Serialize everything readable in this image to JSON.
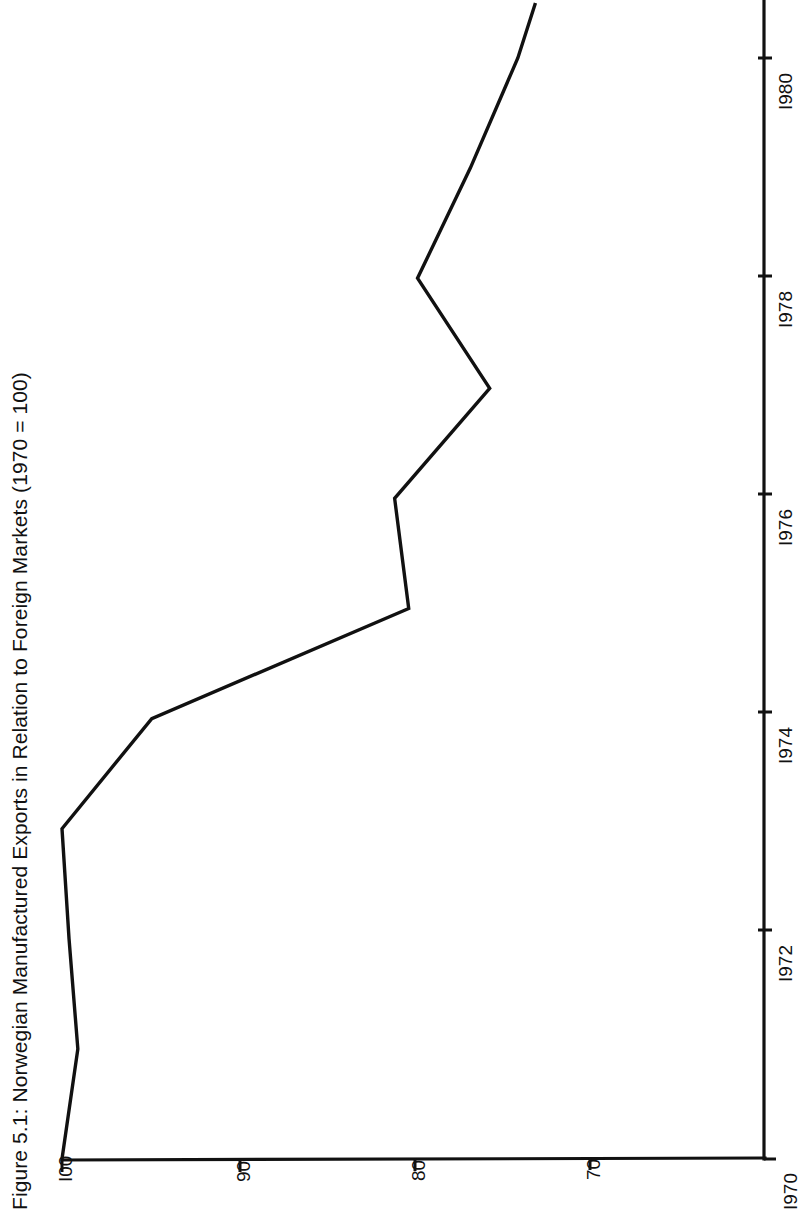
{
  "figure": {
    "title": "Figure 5.1:  Norwegian Manufactured Exports in Relation to Foreign Markets (1970 = 100)",
    "orientation": "rotated-90-ccw",
    "background_color": "#ffffff",
    "line_color": "#111111"
  },
  "axes": {
    "value_axis": {
      "name": "index-axis",
      "tick_labels": [
        "I00",
        "90",
        "80",
        "70"
      ],
      "tick_values": [
        100,
        90,
        80,
        70
      ],
      "min": 70,
      "max": 100
    },
    "time_axis": {
      "name": "year-axis",
      "tick_labels": [
        "I970",
        "I972",
        "I974",
        "I976",
        "I978",
        "I980"
      ],
      "tick_values": [
        1970,
        1972,
        1974,
        1976,
        1978,
        1980
      ],
      "min": 1970,
      "max": 1980.5
    }
  },
  "chart_data": {
    "type": "line",
    "title": "Figure 5.1:  Norwegian Manufactured Exports in Relation to Foreign Markets (1970 = 100)",
    "xlabel": "",
    "ylabel": "",
    "x": [
      1970,
      1971,
      1972,
      1973,
      1974,
      1975,
      1976,
      1977,
      1978,
      1979,
      1980,
      1980.5
    ],
    "values": [
      100.0,
      99.1,
      99.6,
      100.0,
      94.9,
      80.3,
      81.1,
      75.7,
      79.8,
      76.8,
      74.1,
      73.1
    ],
    "series": [
      {
        "name": "Norwegian manufactured exports relative to foreign markets",
        "values": [
          100.0,
          99.1,
          99.6,
          100.0,
          94.9,
          80.3,
          81.1,
          75.7,
          79.8,
          76.8,
          74.1,
          73.1
        ]
      }
    ],
    "xlim": [
      1970,
      1980.5
    ],
    "ylim": [
      70,
      100
    ],
    "grid": false,
    "legend": "none",
    "xtick_labels": [
      "I970",
      "I972",
      "I974",
      "I976",
      "I978",
      "I980"
    ],
    "xticks": [
      1970,
      1972,
      1974,
      1976,
      1978,
      1980
    ],
    "ytick_labels": [
      "I00",
      "90",
      "80",
      "70"
    ],
    "yticks": [
      100,
      90,
      80,
      70
    ],
    "note": "Chart is printed rotated 90 degrees counter-clockwise on the page; the index axis runs horizontally along the bottom and the year axis runs vertically along the right."
  }
}
